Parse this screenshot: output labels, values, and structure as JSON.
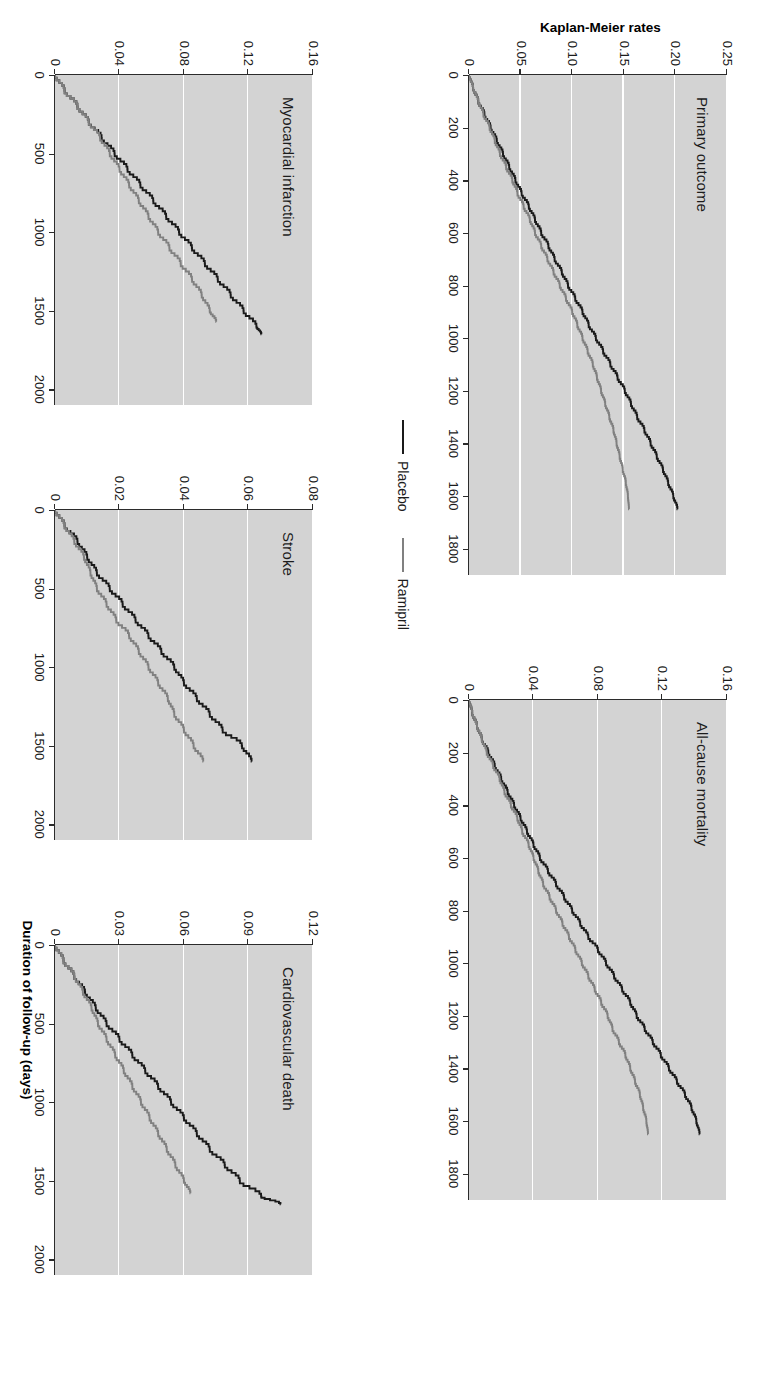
{
  "figure": {
    "x_axis_title": "Duration of follow-up (days)",
    "y_axis_title": "Kaplan-Meier rates",
    "colors": {
      "placebo": "#1a1a1a",
      "ramipril": "#808080",
      "panel_background": "#d3d3d3",
      "gridline": "#ffffff",
      "axis": "#2b2b2b"
    }
  },
  "legend": {
    "items": [
      {
        "label": "Placebo",
        "color": "#1a1a1a"
      },
      {
        "label": "Ramipril",
        "color": "#808080"
      }
    ]
  },
  "chart_data": [
    {
      "type": "line",
      "title": "Primary outcome",
      "xlabel": "Duration of follow-up (days)",
      "ylabel": "Kaplan-Meier rates",
      "xlim": [
        0,
        1900
      ],
      "ylim": [
        0,
        0.25
      ],
      "xticks": [
        0,
        200,
        400,
        600,
        800,
        1000,
        1200,
        1400,
        1600,
        1800
      ],
      "xticklabels": [
        "0",
        "200",
        "400",
        "600",
        "800",
        "1000",
        "1200",
        "1400",
        "1600",
        "1800"
      ],
      "yticks": [
        0,
        0.05,
        0.1,
        0.15,
        0.2,
        0.25
      ],
      "yticklabels": [
        "0",
        "0.05",
        "0.10",
        "0.15",
        "0.20",
        "0.25"
      ],
      "grid": "horizontal-white",
      "legend_position": "figure-center",
      "series": [
        {
          "name": "Placebo",
          "color": "#1a1a1a",
          "x": [
            0,
            50,
            100,
            150,
            200,
            250,
            300,
            350,
            400,
            450,
            500,
            550,
            600,
            650,
            700,
            750,
            800,
            850,
            900,
            950,
            1000,
            1050,
            1100,
            1150,
            1200,
            1250,
            1300,
            1350,
            1400,
            1450,
            1500,
            1550,
            1600,
            1650
          ],
          "y": [
            0.0,
            0.004,
            0.009,
            0.015,
            0.021,
            0.027,
            0.033,
            0.039,
            0.045,
            0.051,
            0.058,
            0.064,
            0.07,
            0.077,
            0.083,
            0.09,
            0.096,
            0.103,
            0.11,
            0.116,
            0.123,
            0.13,
            0.137,
            0.144,
            0.151,
            0.157,
            0.163,
            0.17,
            0.176,
            0.182,
            0.188,
            0.193,
            0.198,
            0.202
          ]
        },
        {
          "name": "Ramipril",
          "color": "#808080",
          "x": [
            0,
            50,
            100,
            150,
            200,
            250,
            300,
            350,
            400,
            450,
            500,
            550,
            600,
            650,
            700,
            750,
            800,
            850,
            900,
            950,
            1000,
            1050,
            1100,
            1150,
            1200,
            1250,
            1300,
            1350,
            1400,
            1450,
            1500,
            1550,
            1600,
            1650
          ],
          "y": [
            0.0,
            0.004,
            0.009,
            0.014,
            0.02,
            0.025,
            0.03,
            0.036,
            0.042,
            0.047,
            0.053,
            0.059,
            0.064,
            0.07,
            0.076,
            0.082,
            0.088,
            0.094,
            0.1,
            0.105,
            0.11,
            0.115,
            0.12,
            0.124,
            0.128,
            0.132,
            0.136,
            0.14,
            0.143,
            0.146,
            0.149,
            0.152,
            0.154,
            0.155
          ]
        }
      ]
    },
    {
      "type": "line",
      "title": "All-cause mortality",
      "xlabel": "Duration of follow-up (days)",
      "ylabel": "Kaplan-Meier rates",
      "xlim": [
        0,
        1900
      ],
      "ylim": [
        0,
        0.16
      ],
      "xticks": [
        0,
        200,
        400,
        600,
        800,
        1000,
        1200,
        1400,
        1600,
        1800
      ],
      "xticklabels": [
        "0",
        "200",
        "400",
        "600",
        "800",
        "1000",
        "1200",
        "1400",
        "1600",
        "1800"
      ],
      "yticks": [
        0,
        0.04,
        0.08,
        0.12,
        0.16
      ],
      "yticklabels": [
        "0",
        "0.04",
        "0.08",
        "0.12",
        "0.16"
      ],
      "grid": "horizontal-white",
      "series": [
        {
          "name": "Placebo",
          "color": "#1a1a1a",
          "x": [
            0,
            50,
            100,
            150,
            200,
            250,
            300,
            350,
            400,
            450,
            500,
            550,
            600,
            650,
            700,
            750,
            800,
            850,
            900,
            950,
            1000,
            1050,
            1100,
            1150,
            1200,
            1250,
            1300,
            1350,
            1400,
            1450,
            1500,
            1550,
            1600,
            1650
          ],
          "y": [
            0.0,
            0.002,
            0.005,
            0.008,
            0.012,
            0.016,
            0.02,
            0.024,
            0.028,
            0.032,
            0.036,
            0.04,
            0.044,
            0.049,
            0.054,
            0.059,
            0.064,
            0.069,
            0.074,
            0.08,
            0.085,
            0.09,
            0.095,
            0.1,
            0.104,
            0.109,
            0.114,
            0.119,
            0.124,
            0.129,
            0.134,
            0.138,
            0.141,
            0.143
          ]
        },
        {
          "name": "Ramipril",
          "color": "#808080",
          "x": [
            0,
            50,
            100,
            150,
            200,
            250,
            300,
            350,
            400,
            450,
            500,
            550,
            600,
            650,
            700,
            750,
            800,
            850,
            900,
            950,
            1000,
            1050,
            1100,
            1150,
            1200,
            1250,
            1300,
            1350,
            1400,
            1450,
            1500,
            1550,
            1600,
            1650
          ],
          "y": [
            0.0,
            0.002,
            0.005,
            0.008,
            0.011,
            0.015,
            0.019,
            0.022,
            0.026,
            0.03,
            0.033,
            0.037,
            0.04,
            0.043,
            0.046,
            0.05,
            0.054,
            0.058,
            0.062,
            0.066,
            0.07,
            0.074,
            0.078,
            0.082,
            0.086,
            0.089,
            0.093,
            0.097,
            0.1,
            0.103,
            0.106,
            0.108,
            0.11,
            0.111
          ]
        }
      ]
    },
    {
      "type": "line",
      "title": "Myocardial infarction",
      "xlabel": "Duration of follow-up (days)",
      "ylabel": "Kaplan-Meier rates",
      "xlim": [
        0,
        2100
      ],
      "ylim": [
        0,
        0.16
      ],
      "xticks": [
        0,
        500,
        1000,
        1500,
        2000
      ],
      "xticklabels": [
        "0",
        "500",
        "1000",
        "1500",
        "2000"
      ],
      "yticks": [
        0,
        0.04,
        0.08,
        0.12,
        0.16
      ],
      "yticklabels": [
        "0",
        "0.04",
        "0.08",
        "0.12",
        "0.16"
      ],
      "grid": "horizontal-white",
      "series": [
        {
          "name": "Placebo",
          "color": "#1a1a1a",
          "x": [
            0,
            100,
            200,
            300,
            400,
            500,
            600,
            700,
            800,
            900,
            1000,
            1100,
            1200,
            1300,
            1400,
            1500,
            1600,
            1650
          ],
          "y": [
            0.0,
            0.006,
            0.014,
            0.021,
            0.029,
            0.037,
            0.045,
            0.053,
            0.061,
            0.069,
            0.077,
            0.085,
            0.093,
            0.101,
            0.109,
            0.117,
            0.125,
            0.128
          ]
        },
        {
          "name": "Ramipril",
          "color": "#808080",
          "x": [
            0,
            100,
            200,
            300,
            400,
            500,
            600,
            700,
            800,
            900,
            1000,
            1100,
            1200,
            1300,
            1400,
            1500,
            1570
          ],
          "y": [
            0.0,
            0.006,
            0.014,
            0.021,
            0.028,
            0.034,
            0.04,
            0.046,
            0.052,
            0.058,
            0.064,
            0.071,
            0.078,
            0.085,
            0.091,
            0.096,
            0.1
          ]
        }
      ]
    },
    {
      "type": "line",
      "title": "Stroke",
      "xlabel": "Duration of follow-up (days)",
      "ylabel": "Kaplan-Meier rates",
      "xlim": [
        0,
        2100
      ],
      "ylim": [
        0,
        0.08
      ],
      "xticks": [
        0,
        500,
        1000,
        1500,
        2000
      ],
      "xticklabels": [
        "0",
        "500",
        "1000",
        "1500",
        "2000"
      ],
      "yticks": [
        0,
        0.02,
        0.04,
        0.06,
        0.08
      ],
      "yticklabels": [
        "0",
        "0.02",
        "0.04",
        "0.06",
        "0.08"
      ],
      "grid": "horizontal-white",
      "series": [
        {
          "name": "Placebo",
          "color": "#1a1a1a",
          "x": [
            0,
            100,
            200,
            300,
            400,
            500,
            600,
            700,
            800,
            900,
            1000,
            1100,
            1200,
            1300,
            1400,
            1500,
            1600
          ],
          "y": [
            0.0,
            0.003,
            0.007,
            0.01,
            0.013,
            0.017,
            0.021,
            0.025,
            0.029,
            0.033,
            0.037,
            0.04,
            0.044,
            0.048,
            0.052,
            0.058,
            0.061
          ]
        },
        {
          "name": "Ramipril",
          "color": "#808080",
          "x": [
            0,
            100,
            200,
            300,
            400,
            500,
            600,
            700,
            800,
            900,
            1000,
            1100,
            1200,
            1300,
            1400,
            1500,
            1600
          ],
          "y": [
            0.0,
            0.003,
            0.006,
            0.009,
            0.011,
            0.013,
            0.016,
            0.019,
            0.023,
            0.026,
            0.029,
            0.032,
            0.035,
            0.037,
            0.04,
            0.043,
            0.046
          ]
        }
      ]
    },
    {
      "type": "line",
      "title": "Cardiovascular death",
      "xlabel": "Duration of follow-up (days)",
      "ylabel": "Kaplan-Meier rates",
      "xlim": [
        0,
        2100
      ],
      "ylim": [
        0,
        0.12
      ],
      "xticks": [
        0,
        500,
        1000,
        1500,
        2000
      ],
      "xticklabels": [
        "0",
        "500",
        "1000",
        "1500",
        "2000"
      ],
      "yticks": [
        0,
        0.03,
        0.06,
        0.09,
        0.12
      ],
      "yticklabels": [
        "0",
        "0.03",
        "0.06",
        "0.09",
        "0.12"
      ],
      "grid": "horizontal-white",
      "series": [
        {
          "name": "Placebo",
          "color": "#1a1a1a",
          "x": [
            0,
            100,
            200,
            300,
            400,
            500,
            600,
            700,
            800,
            900,
            1000,
            1100,
            1200,
            1300,
            1400,
            1500,
            1600,
            1650
          ],
          "y": [
            0.0,
            0.004,
            0.009,
            0.014,
            0.019,
            0.024,
            0.03,
            0.036,
            0.042,
            0.048,
            0.054,
            0.06,
            0.066,
            0.072,
            0.079,
            0.086,
            0.096,
            0.105
          ]
        },
        {
          "name": "Ramipril",
          "color": "#808080",
          "x": [
            0,
            100,
            200,
            300,
            400,
            500,
            600,
            700,
            800,
            900,
            1000,
            1100,
            1200,
            1300,
            1400,
            1500,
            1580
          ],
          "y": [
            0.0,
            0.004,
            0.009,
            0.013,
            0.017,
            0.02,
            0.024,
            0.028,
            0.032,
            0.036,
            0.04,
            0.044,
            0.048,
            0.052,
            0.056,
            0.06,
            0.063
          ]
        }
      ]
    }
  ]
}
